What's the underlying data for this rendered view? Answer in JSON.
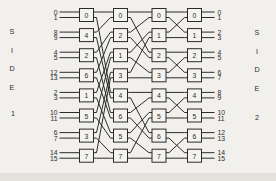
{
  "figure": {
    "side_left": {
      "word": [
        "S",
        "I",
        "D",
        "E"
      ],
      "number": "1"
    },
    "side_right": {
      "word": [
        "S",
        "I",
        "D",
        "E"
      ],
      "number": "2"
    },
    "left_port_labels": [
      "0",
      "1",
      "8",
      "9",
      "4",
      "5",
      "12",
      "13",
      "2",
      "3",
      "10",
      "11",
      "6",
      "7",
      "14",
      "15"
    ],
    "right_port_labels": [
      "0",
      "1",
      "2",
      "3",
      "4",
      "5",
      "6",
      "7",
      "8",
      "9",
      "10",
      "11",
      "12",
      "13",
      "14",
      "15"
    ],
    "stages": [
      {
        "switches": [
          "0",
          "4",
          "2",
          "6",
          "1",
          "5",
          "3",
          "7"
        ]
      },
      {
        "switches": [
          "0",
          "2",
          "1",
          "3",
          "4",
          "6",
          "5",
          "7"
        ]
      },
      {
        "switches": [
          "0",
          "1",
          "2",
          "3",
          "4",
          "5",
          "6",
          "7"
        ]
      },
      {
        "switches": [
          "0",
          "1",
          "2",
          "3",
          "4",
          "5",
          "6",
          "7"
        ]
      }
    ],
    "interstage_links": [
      [
        [
          0,
          0,
          0,
          0
        ],
        [
          0,
          1,
          4,
          0
        ],
        [
          1,
          0,
          0,
          1
        ],
        [
          1,
          1,
          4,
          1
        ],
        [
          2,
          0,
          1,
          0
        ],
        [
          2,
          1,
          5,
          0
        ],
        [
          3,
          0,
          1,
          1
        ],
        [
          3,
          1,
          5,
          1
        ],
        [
          4,
          0,
          2,
          0
        ],
        [
          4,
          1,
          6,
          0
        ],
        [
          5,
          0,
          2,
          1
        ],
        [
          5,
          1,
          6,
          1
        ],
        [
          6,
          0,
          3,
          0
        ],
        [
          6,
          1,
          7,
          0
        ],
        [
          7,
          0,
          3,
          1
        ],
        [
          7,
          1,
          7,
          1
        ]
      ],
      [
        [
          0,
          0,
          0,
          0
        ],
        [
          0,
          1,
          2,
          0
        ],
        [
          1,
          0,
          0,
          1
        ],
        [
          1,
          1,
          2,
          1
        ],
        [
          2,
          0,
          1,
          0
        ],
        [
          2,
          1,
          3,
          0
        ],
        [
          3,
          0,
          1,
          1
        ],
        [
          3,
          1,
          3,
          1
        ],
        [
          4,
          0,
          4,
          0
        ],
        [
          4,
          1,
          6,
          0
        ],
        [
          5,
          0,
          4,
          1
        ],
        [
          5,
          1,
          6,
          1
        ],
        [
          6,
          0,
          5,
          0
        ],
        [
          6,
          1,
          7,
          0
        ],
        [
          7,
          0,
          5,
          1
        ],
        [
          7,
          1,
          7,
          1
        ]
      ],
      [
        [
          0,
          0,
          0,
          0
        ],
        [
          0,
          1,
          1,
          0
        ],
        [
          1,
          0,
          0,
          1
        ],
        [
          1,
          1,
          1,
          1
        ],
        [
          2,
          0,
          2,
          0
        ],
        [
          2,
          1,
          3,
          0
        ],
        [
          3,
          0,
          2,
          1
        ],
        [
          3,
          1,
          3,
          1
        ],
        [
          4,
          0,
          4,
          0
        ],
        [
          4,
          1,
          5,
          0
        ],
        [
          5,
          0,
          4,
          1
        ],
        [
          5,
          1,
          5,
          1
        ],
        [
          6,
          0,
          6,
          0
        ],
        [
          6,
          1,
          7,
          0
        ],
        [
          7,
          0,
          6,
          1
        ],
        [
          7,
          1,
          7,
          1
        ]
      ]
    ],
    "colors": {
      "background": "#f1f0ed",
      "ink": "#2b2b2b",
      "box_fill": "#f4f3f0",
      "bottom_shadow": "#d8d5cf"
    }
  }
}
